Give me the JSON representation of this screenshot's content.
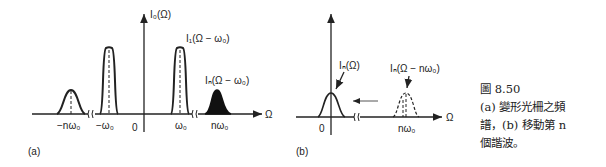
{
  "panel_a": {
    "y_axis_label": "I₀(Ω)",
    "x_axis_label": "Ω",
    "peak_label_1": "I₁(Ω − ω₀)",
    "peak_label_n": "Iₙ(Ω − ω₀)",
    "ticks": [
      "−nω₀",
      "−ω₀",
      "0",
      "ω₀",
      "nω₀"
    ],
    "panel_label": "(a)"
  },
  "panel_b": {
    "peak_label_center": "Iₙ(Ω)",
    "peak_label_shifted": "Iₙ(Ω − nω₀)",
    "x_axis_label": "Ω",
    "ticks": [
      "0",
      "nω₀"
    ],
    "panel_label": "(b)"
  },
  "caption": {
    "figure_number": "圖 8.50",
    "line1": "(a) 變形光柵之頻",
    "line2": "譜，(b) 移動第 n",
    "line3": "個諧波。"
  }
}
